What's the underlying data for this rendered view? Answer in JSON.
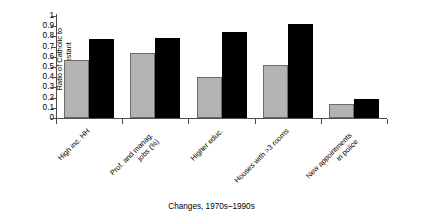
{
  "chart_data": {
    "type": "bar",
    "title": "",
    "xlabel": "Changes, 1970s–1990s",
    "ylabel": "Ratio of Catholic to Protestant",
    "ylabel_lines": [
      "Ratio of Catholic to",
      "Protestant"
    ],
    "categories": [
      "High inc. HH",
      "Prof. and manag. jobs (%)",
      "Higher educ.",
      "Houses with >3 rooms",
      "New appointments in police"
    ],
    "category_lines": [
      [
        "High inc. HH"
      ],
      [
        "Prof. and manag.",
        "jobs (%)"
      ],
      [
        "Higher educ."
      ],
      [
        "Houses with >3 rooms"
      ],
      [
        "New appointments",
        "in police"
      ]
    ],
    "series": [
      {
        "name": "1970s",
        "color": "#b3b3b3",
        "values": [
          0.565,
          0.635,
          0.4,
          0.515,
          0.14
        ]
      },
      {
        "name": "1990s",
        "color": "#000000",
        "values": [
          0.775,
          0.78,
          0.84,
          0.92,
          0.185
        ]
      }
    ],
    "ylim": [
      0,
      1
    ],
    "ytick_values": [
      0,
      0.1,
      0.2,
      0.3,
      0.4,
      0.5,
      0.6,
      0.7,
      0.8,
      0.9,
      1
    ],
    "ytick_labels": [
      "0",
      "0.1",
      "0.2",
      "0.3",
      "0.4",
      "0.5",
      "0.6",
      "0.7",
      "0.8",
      "0.9",
      "1"
    ],
    "grid": false,
    "legend": "none",
    "label_rotation_deg": -45
  }
}
